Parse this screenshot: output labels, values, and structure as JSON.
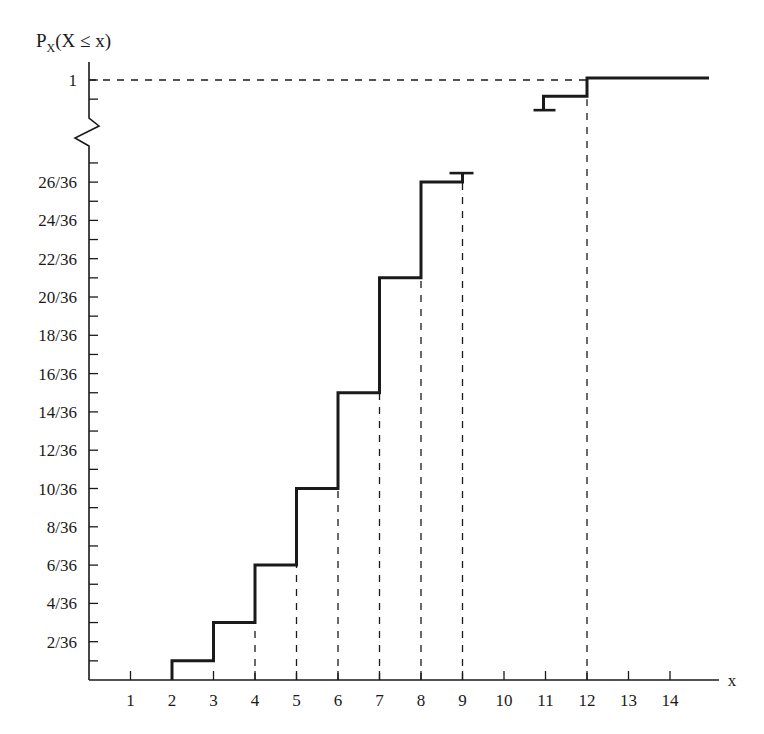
{
  "chart_data": {
    "type": "line",
    "subtype": "step (cumulative distribution function)",
    "title": "",
    "ylabel": "P_X(X ≤ x)",
    "ylabel_parts": {
      "main": "P",
      "sub": "X",
      "rest": "(X ≤ x)"
    },
    "xlabel": "x",
    "x_ticks": [
      1,
      2,
      3,
      4,
      5,
      6,
      7,
      8,
      9,
      10,
      11,
      12,
      13,
      14
    ],
    "y_tick_labels": [
      "2/36",
      "4/36",
      "6/36",
      "8/36",
      "10/36",
      "12/36",
      "14/36",
      "16/36",
      "18/36",
      "20/36",
      "22/36",
      "24/36",
      "26/36",
      "1"
    ],
    "y_minor_tick_step": "1/36",
    "y_axis_break": {
      "between": [
        "27/36",
        "35/36"
      ],
      "style": "zigzag"
    },
    "xlim": [
      0,
      14.8
    ],
    "ylim": [
      0,
      1
    ],
    "grid": false,
    "legend": null,
    "x": [
      2,
      3,
      4,
      5,
      6,
      7,
      8,
      9,
      10,
      11,
      12
    ],
    "values": [
      1,
      3,
      6,
      10,
      15,
      21,
      26,
      30,
      33,
      35,
      36
    ],
    "values_denominator": 36,
    "values_fraction": [
      "1/36",
      "3/36",
      "6/36",
      "10/36",
      "15/36",
      "21/36",
      "26/36",
      "30/36",
      "33/36",
      "35/36",
      "36/36"
    ],
    "dashed_guides": {
      "vertical_at_x": [
        4,
        5,
        6,
        7,
        8,
        9,
        12
      ],
      "horizontal_at_y": "1"
    }
  },
  "labels": {
    "ylabel_main": "P",
    "ylabel_sub": "X",
    "ylabel_rest": "(X ≤ x)",
    "xlabel": "x",
    "y_ticks": [
      {
        "text": "2/36",
        "k": 2
      },
      {
        "text": "4/36",
        "k": 4
      },
      {
        "text": "6/36",
        "k": 6
      },
      {
        "text": "8/36",
        "k": 8
      },
      {
        "text": "10/36",
        "k": 10
      },
      {
        "text": "12/36",
        "k": 12
      },
      {
        "text": "14/36",
        "k": 14
      },
      {
        "text": "16/36",
        "k": 16
      },
      {
        "text": "18/36",
        "k": 18
      },
      {
        "text": "20/36",
        "k": 20
      },
      {
        "text": "22/36",
        "k": 22
      },
      {
        "text": "24/36",
        "k": 24
      },
      {
        "text": "26/36",
        "k": 26
      }
    ],
    "y_top_label": "1",
    "x_ticks": [
      "1",
      "2",
      "3",
      "4",
      "5",
      "6",
      "7",
      "8",
      "9",
      "10",
      "11",
      "12",
      "13",
      "14"
    ]
  },
  "colors": {
    "line": "#1a1a1a",
    "background": "#ffffff"
  }
}
